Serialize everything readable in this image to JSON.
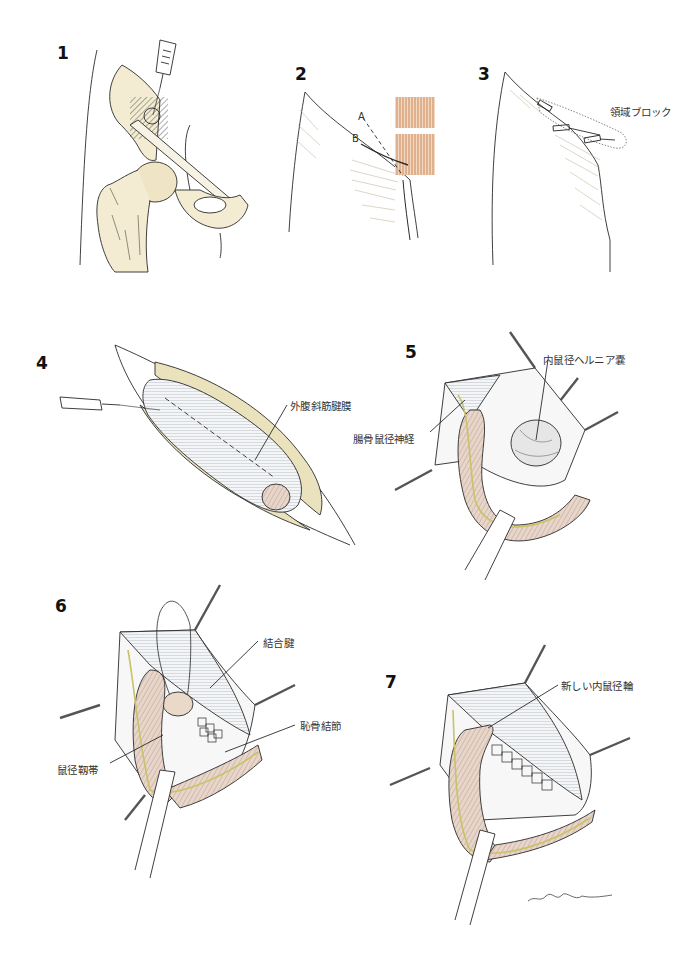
{
  "figure": {
    "panels": [
      {
        "number": "1",
        "labels": []
      },
      {
        "number": "2",
        "labels": [
          "A",
          "B"
        ]
      },
      {
        "number": "3",
        "labels": [
          "領域ブロック"
        ]
      },
      {
        "number": "4",
        "labels": [
          "外腹斜筋腱膜"
        ]
      },
      {
        "number": "5",
        "labels": [
          "内鼠径ヘルニア嚢",
          "腸骨鼠径神経"
        ]
      },
      {
        "number": "6",
        "labels": [
          "結合腱",
          "恥骨結節",
          "鼠径靱帯"
        ]
      },
      {
        "number": "7",
        "labels": [
          "新しい内鼠径輪"
        ]
      }
    ],
    "colors": {
      "line": "#2a2a2a",
      "bone": "#f3ecd2",
      "fat": "#e9e2bd",
      "muscle": "#d9a47a",
      "cord": "#e3cdbf",
      "nerve": "#dcd68a",
      "fascia": "#eef0f3"
    }
  }
}
